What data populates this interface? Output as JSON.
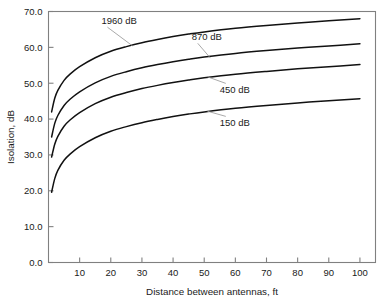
{
  "chart_data": {
    "type": "line",
    "title": "",
    "xlabel": "Distance between antennas, ft",
    "ylabel": "Isolation, dB",
    "xlim": [
      0,
      105
    ],
    "ylim": [
      0,
      70
    ],
    "grid": false,
    "legend_position": "inline-annotations",
    "xticks": [
      "10",
      "20",
      "30",
      "40",
      "50",
      "60",
      "70",
      "80",
      "90",
      "100"
    ],
    "xtick_values": [
      10,
      20,
      30,
      40,
      50,
      60,
      70,
      80,
      90,
      100
    ],
    "yticks": [
      "0.0",
      "10.0",
      "20.0",
      "30.0",
      "40.0",
      "50.0",
      "60.0",
      "70.0"
    ],
    "ytick_values": [
      0,
      10,
      20,
      30,
      40,
      50,
      60,
      70
    ],
    "x": [
      1,
      2,
      3,
      5,
      7,
      10,
      15,
      20,
      25,
      30,
      35,
      40,
      45,
      50,
      60,
      70,
      80,
      90,
      100
    ],
    "series": [
      {
        "name": "1960 dB",
        "label": "1960 dB",
        "values": [
          42.0,
          45.8,
          48.0,
          50.8,
          52.6,
          54.6,
          57.1,
          58.9,
          60.2,
          61.3,
          62.2,
          63.0,
          63.7,
          64.3,
          65.3,
          66.1,
          66.8,
          67.4,
          68.0
        ]
      },
      {
        "name": "870 dB",
        "label": "870 dB",
        "values": [
          35.0,
          38.8,
          41.0,
          43.8,
          45.6,
          47.6,
          50.1,
          51.9,
          53.2,
          54.3,
          55.2,
          56.0,
          56.7,
          57.3,
          58.3,
          59.1,
          59.8,
          60.4,
          61.0
        ]
      },
      {
        "name": "450 dB",
        "label": "450 dB",
        "values": [
          29.4,
          33.0,
          35.2,
          38.0,
          39.8,
          41.8,
          44.3,
          46.1,
          47.4,
          48.5,
          49.4,
          50.2,
          50.9,
          51.5,
          52.5,
          53.3,
          54.0,
          54.6,
          55.2
        ]
      },
      {
        "name": "150 dB",
        "label": "150 dB",
        "values": [
          19.6,
          23.4,
          25.7,
          28.5,
          30.3,
          32.3,
          34.8,
          36.6,
          37.9,
          39.0,
          39.9,
          40.7,
          41.4,
          42.0,
          43.0,
          43.8,
          44.5,
          45.1,
          45.7
        ]
      }
    ],
    "annotations": [
      {
        "text": "1960 dB",
        "text_x": 17,
        "text_y": 66.6,
        "leader_to_x": 27,
        "leader_to_y": 60.4
      },
      {
        "text": "870 dB",
        "text_x": 46,
        "text_y": 62.1,
        "leader_to_x": 52,
        "leader_to_y": 57.0
      },
      {
        "text": "450 dB",
        "text_x": 55,
        "text_y": 47.3,
        "leader_to_x": 51,
        "leader_to_y": 51.8
      },
      {
        "text": "150 dB",
        "text_x": 55,
        "text_y": 38.1,
        "leader_to_x": 51,
        "leader_to_y": 42.2
      }
    ]
  },
  "colors": {
    "curve": "#111111",
    "axis": "#808080",
    "text": "#1a1a1a",
    "leader": "#9a9a9a",
    "background": "#ffffff"
  }
}
